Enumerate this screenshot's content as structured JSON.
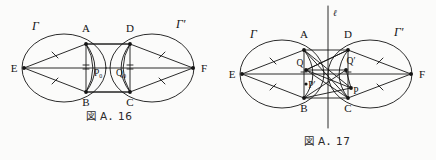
{
  "page": {
    "background": "#fbfbfa",
    "ink": "#141414",
    "width": 436,
    "height": 160
  },
  "figures": [
    {
      "id": "fig-a-16",
      "caption": "図 A．16",
      "caption_kanji": "図",
      "caption_label": "A．16",
      "description": "Two equal circles Gamma and Gamma-prime meeting region with inscribed quadrilateral ABCD, apex points E and F, and interior points P-zero and Q-zero.",
      "labels": [
        {
          "name": "gamma",
          "text": "Γ",
          "x": 32,
          "y": 30
        },
        {
          "name": "gamma-prime",
          "text": "Γ′",
          "x": 176,
          "y": 28
        },
        {
          "name": "point-a",
          "text": "A",
          "x": 76,
          "y": 32
        },
        {
          "name": "point-b",
          "text": "B",
          "x": 76,
          "y": 102
        },
        {
          "name": "point-c",
          "text": "C",
          "x": 141,
          "y": 102
        },
        {
          "name": "point-d",
          "text": "D",
          "x": 141,
          "y": 32
        },
        {
          "name": "point-e",
          "text": "E",
          "x": 16,
          "y": 70
        },
        {
          "name": "point-f",
          "text": "F",
          "x": 200,
          "y": 70
        },
        {
          "name": "point-p0",
          "text": "P",
          "sub": "0",
          "x": 95,
          "y": 72
        },
        {
          "name": "point-q0",
          "text": "Q",
          "sub": "0",
          "x": 121,
          "y": 72
        }
      ]
    },
    {
      "id": "fig-a-17",
      "caption": "図 A．17",
      "caption_kanji": "図",
      "caption_label": "A．17",
      "description": "Same two-circle configuration with vertical axis line ell, interior points Q, Q-prime, P and P-prime joined by crossing chords.",
      "labels": [
        {
          "name": "gamma",
          "text": "Γ",
          "x": 32,
          "y": 35
        },
        {
          "name": "gamma-prime",
          "text": "Γ′",
          "x": 176,
          "y": 35
        },
        {
          "name": "line-ell",
          "text": "ℓ",
          "x": 122,
          "y": 14
        },
        {
          "name": "point-a",
          "text": "A",
          "x": 76,
          "y": 38
        },
        {
          "name": "point-b",
          "text": "B",
          "x": 76,
          "y": 108
        },
        {
          "name": "point-c",
          "text": "C",
          "x": 141,
          "y": 108
        },
        {
          "name": "point-d",
          "text": "D",
          "x": 141,
          "y": 38
        },
        {
          "name": "point-e",
          "text": "E",
          "x": 16,
          "y": 76
        },
        {
          "name": "point-f",
          "text": "F",
          "x": 200,
          "y": 76
        },
        {
          "name": "point-q",
          "text": "Q",
          "x": 78,
          "y": 64
        },
        {
          "name": "point-q-prime",
          "text": "Q′",
          "x": 133,
          "y": 64
        },
        {
          "name": "point-p-prime",
          "text": "P′",
          "x": 84,
          "y": 85
        },
        {
          "name": "point-p",
          "text": "P",
          "x": 136,
          "y": 86
        }
      ]
    }
  ]
}
